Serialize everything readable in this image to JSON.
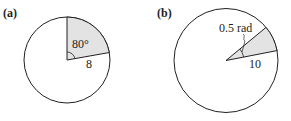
{
  "figure": {
    "panels": [
      {
        "label": "(a)",
        "angle_label": "80°",
        "radius_label": "8",
        "angle_degrees": 80,
        "radius": 8
      },
      {
        "label": "(b)",
        "angle_label": "0.5 rad",
        "radius_label": "10",
        "angle_radians": 0.5,
        "radius": 10
      }
    ],
    "colors": {
      "stroke": "#231f20",
      "sector_fill": "#e3e3e3",
      "background": "#ffffff"
    }
  }
}
